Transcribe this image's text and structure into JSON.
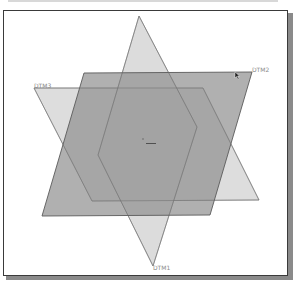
{
  "viewport": {
    "description": "3D CAD graphics window showing three default datum planes"
  },
  "datum_planes": [
    {
      "id": "DTM1",
      "label": "DTM1",
      "shape": "rhombus",
      "points": [
        [
          139,
          16
        ],
        [
          197,
          127
        ],
        [
          153,
          266
        ],
        [
          98,
          155
        ]
      ],
      "fill": "#d6d6d6",
      "stroke": "#8c8c8c"
    },
    {
      "id": "DTM2",
      "label": "DTM2",
      "shape": "parallelogram",
      "points": [
        [
          84,
          73
        ],
        [
          252,
          72
        ],
        [
          210,
          215
        ],
        [
          42,
          216
        ]
      ],
      "fill": "#9e9e9e",
      "stroke": "#5e5e5e",
      "highlighted": true
    },
    {
      "id": "DTM3",
      "label": "DTM3",
      "shape": "parallelogram",
      "points": [
        [
          34,
          88
        ],
        [
          203,
          88
        ],
        [
          259,
          200
        ],
        [
          92,
          201
        ]
      ],
      "fill": "#d6d6d6",
      "stroke": "#8c8c8c"
    }
  ],
  "labels": {
    "dtm1": "DTM1",
    "dtm2": "DTM2",
    "dtm3": "DTM3"
  },
  "colors": {
    "frame_border": "#3a3a3a",
    "frame_shadow": "#8a8a8a",
    "background": "#ffffff",
    "label_text": "#8a8a8a"
  },
  "cursor": {
    "type": "arrow",
    "position": [
      236,
      73
    ]
  }
}
